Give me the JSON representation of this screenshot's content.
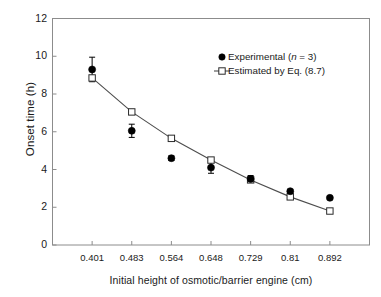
{
  "chart_data": {
    "type": "line",
    "title": "",
    "xlabel": "Initial height of osmotic/barrier engine (cm)",
    "ylabel": "Onset time (h)",
    "categories": [
      "0.401",
      "0.483",
      "0.564",
      "0.648",
      "0.729",
      "0.81",
      "0.892"
    ],
    "x": [
      0.401,
      0.483,
      0.564,
      0.648,
      0.729,
      0.81,
      0.892
    ],
    "xtick_labels": [
      "0.401",
      "0.483",
      "0.564",
      "0.648",
      "0.729",
      "0.81",
      "0.892"
    ],
    "ytick_labels": [
      "0",
      "2",
      "4",
      "6",
      "8",
      "10",
      "12"
    ],
    "yticks": [
      0,
      2,
      4,
      6,
      8,
      10,
      12
    ],
    "ylim": [
      0,
      12
    ],
    "grid": false,
    "legend_position": "top-right",
    "series": [
      {
        "name": "Experimental",
        "legend_label": "Experimental (n = 3)",
        "legend_label_prefix": "Experimental (",
        "legend_label_italic": "n",
        "legend_label_suffix": " = 3)",
        "marker": "filled-circle",
        "color": "#000000",
        "line": false,
        "values": [
          9.3,
          6.05,
          4.6,
          4.1,
          3.5,
          2.85,
          2.5
        ],
        "error_upper": [
          0.65,
          0.35,
          0.12,
          0.3,
          0.18,
          0.1,
          0.08
        ],
        "error_lower": [
          0.65,
          0.35,
          0.12,
          0.3,
          0.18,
          0.1,
          0.08
        ]
      },
      {
        "name": "Estimated by Eq. (8.7)",
        "legend_label": "Estimated by Eq. (8.7)",
        "marker": "open-square",
        "color": "#000000",
        "line": true,
        "values": [
          8.85,
          7.05,
          5.65,
          4.5,
          3.45,
          2.55,
          1.8
        ]
      }
    ],
    "colors": {
      "axis": "#8c8c8c",
      "text": "#1a1a1a",
      "marker_filled": "#000000",
      "marker_open_fill": "#ffffff",
      "line": "#4d4d4d",
      "background": "#ffffff"
    }
  }
}
